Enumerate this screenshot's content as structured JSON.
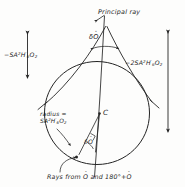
{
  "figure": {
    "kind": "hand-drawn optics ray geometry sketch"
  },
  "labels": {
    "principal_ray": "Principal ray",
    "left_formula_prefix": "−S",
    "right_formula_prefix": "−2S",
    "formula_A": "A",
    "formula_A_exp": "2",
    "formula_H": "H",
    "formula_H_prime": "′",
    "formula_H_sub": "6",
    "formula_O": "O",
    "formula_O_sub": "2",
    "apex_angle": "δ",
    "apex_angle_var": "O",
    "center": "C",
    "radius_word": "radius =",
    "inner_angle": "δ",
    "inner_angle_var": "O",
    "caption_part1": "Rays from",
    "caption_var1": "O",
    "caption_part2": "and 180°+",
    "caption_var2": "O"
  },
  "colors": {
    "ink": "#1f1f1f",
    "paper": "#fdfdfc",
    "stroke": "#242424"
  },
  "geometry": {
    "apex": {
      "x": 106,
      "y": 25
    },
    "circle_center": {
      "x": 97,
      "y": 113
    },
    "circle_radius": 52,
    "axis_top": {
      "x": 104,
      "y": 16
    },
    "axis_bottom": {
      "x": 94,
      "y": 176
    },
    "tangent_left_end": {
      "x": 40,
      "y": 104
    },
    "tangent_right_end": {
      "x": 154,
      "y": 104
    },
    "left_arrow": {
      "x": 27,
      "y_top": 32,
      "y_bottom": 78
    },
    "right_arrow": {
      "x": 168,
      "y_top": 31,
      "y_bottom": 131
    }
  }
}
